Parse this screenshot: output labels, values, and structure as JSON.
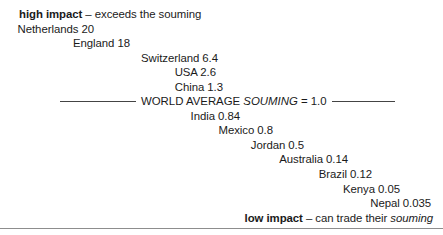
{
  "figure": {
    "top_caption": {
      "lead": "high impact",
      "dash": " – ",
      "rest": "exceeds the souming"
    },
    "bottom_caption": {
      "lead": "low impact",
      "dash": " – ",
      "rest_plain": "can trade their ",
      "rest_italic": "souming"
    },
    "average_divider": {
      "label_before": "WORLD AVERAGE ",
      "label_italic": "SOUMING",
      "label_after": " = 1.0"
    },
    "rows": [
      {
        "label": "Netherlands 20",
        "country": "Netherlands",
        "value": 20
      },
      {
        "label": "England 18",
        "country": "England",
        "value": 18
      },
      {
        "label": "Switzerland 6.4",
        "country": "Switzerland",
        "value": 6.4
      },
      {
        "label": "USA 2.6",
        "country": "USA",
        "value": 2.6
      },
      {
        "label": "China 1.3",
        "country": "China",
        "value": 1.3
      },
      {
        "label": "India 0.84",
        "country": "India",
        "value": 0.84
      },
      {
        "label": "Mexico 0.8",
        "country": "Mexico",
        "value": 0.8
      },
      {
        "label": "Jordan 0.5",
        "country": "Jordan",
        "value": 0.5
      },
      {
        "label": "Australia 0.14",
        "country": "Australia",
        "value": 0.14
      },
      {
        "label": "Brazil 0.12",
        "country": "Brazil",
        "value": 0.12
      },
      {
        "label": "Kenya 0.05",
        "country": "Kenya",
        "value": 0.05
      },
      {
        "label": "Nepal 0.035",
        "country": "Nepal",
        "value": 0.035
      }
    ],
    "colors": {
      "text": "#1a1a1a",
      "background": "#ffffff",
      "rule": "#444444",
      "bottom_rule": "#8d8d8d"
    }
  },
  "chart_data": {
    "type": "bar",
    "title": "",
    "xlabel": "",
    "ylabel": "souming",
    "categories": [
      "Netherlands",
      "England",
      "Switzerland",
      "USA",
      "China",
      "India",
      "Mexico",
      "Jordan",
      "Australia",
      "Brazil",
      "Kenya",
      "Nepal"
    ],
    "values": [
      20,
      18,
      6.4,
      2.6,
      1.3,
      0.84,
      0.8,
      0.5,
      0.14,
      0.12,
      0.05,
      0.035
    ],
    "reference_line": {
      "label": "WORLD AVERAGE SOUMING",
      "value": 1.0
    },
    "annotations": [
      "high impact – exceeds the souming",
      "low impact – can trade their souming"
    ],
    "ylim": [
      0.035,
      20
    ],
    "grid": false,
    "legend": "none"
  }
}
